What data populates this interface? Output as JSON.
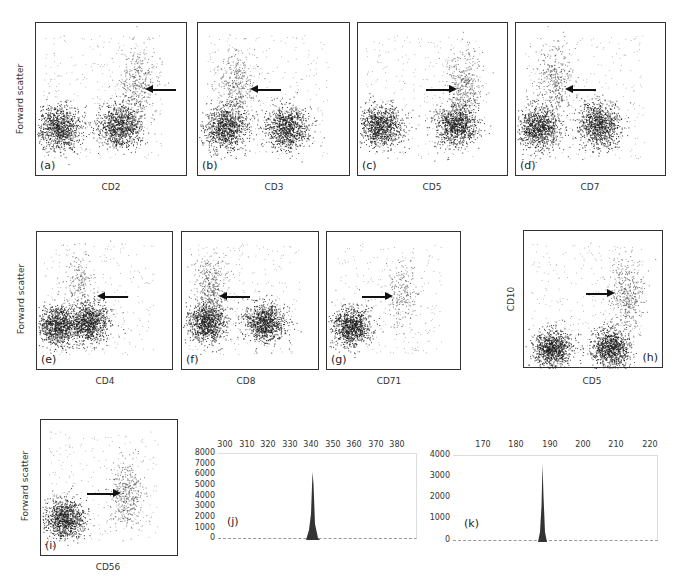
{
  "figure": {
    "scatter_panels": [
      {
        "id": "a",
        "label": "(a)",
        "xlabel": "CD2",
        "ylabel": "Forward scatter",
        "arrow": "left"
      },
      {
        "id": "b",
        "label": "(b)",
        "xlabel": "CD3",
        "ylabel": "",
        "arrow": "left"
      },
      {
        "id": "c",
        "label": "(c)",
        "xlabel": "CD5",
        "ylabel": "",
        "arrow": "right"
      },
      {
        "id": "d",
        "label": "(d)",
        "xlabel": "CD7",
        "ylabel": "",
        "arrow": "left"
      },
      {
        "id": "e",
        "label": "(e)",
        "xlabel": "CD4",
        "ylabel": "Forward scatter",
        "arrow": "left"
      },
      {
        "id": "f",
        "label": "(f)",
        "xlabel": "CD8",
        "ylabel": "",
        "arrow": "left"
      },
      {
        "id": "g",
        "label": "(g)",
        "xlabel": "CD71",
        "ylabel": "",
        "arrow": "right"
      },
      {
        "id": "h",
        "label": "(h)",
        "xlabel": "CD5",
        "ylabel": "CD10",
        "arrow": "right"
      },
      {
        "id": "i",
        "label": "(i)",
        "xlabel": "CD56",
        "ylabel": "Forward scatter",
        "arrow": "right"
      }
    ]
  },
  "chart_data": [
    {
      "type": "scatter",
      "panel": "(a)",
      "title": "",
      "xlabel": "CD2",
      "ylabel": "Forward scatter",
      "annotation": "arrow pointing left at CD2-bright high-FSC population",
      "clusters": [
        {
          "x": 0.15,
          "y": 0.32,
          "density": "high"
        },
        {
          "x": 0.55,
          "y": 0.33,
          "density": "high"
        },
        {
          "x": 0.67,
          "y": 0.6,
          "density": "medium",
          "note": "arrow target"
        }
      ]
    },
    {
      "type": "scatter",
      "panel": "(b)",
      "title": "",
      "xlabel": "CD3",
      "ylabel": "",
      "annotation": "arrow pointing left at CD3-negative high-FSC population",
      "clusters": [
        {
          "x": 0.18,
          "y": 0.32,
          "density": "high"
        },
        {
          "x": 0.58,
          "y": 0.32,
          "density": "high"
        },
        {
          "x": 0.25,
          "y": 0.58,
          "density": "medium",
          "note": "arrow target"
        }
      ]
    },
    {
      "type": "scatter",
      "panel": "(c)",
      "title": "",
      "xlabel": "CD5",
      "ylabel": "",
      "annotation": "arrow pointing right at CD5-bright high-FSC population",
      "clusters": [
        {
          "x": 0.15,
          "y": 0.33,
          "density": "high"
        },
        {
          "x": 0.65,
          "y": 0.34,
          "density": "high"
        },
        {
          "x": 0.7,
          "y": 0.6,
          "density": "medium",
          "note": "arrow target"
        }
      ]
    },
    {
      "type": "scatter",
      "panel": "(d)",
      "title": "",
      "xlabel": "CD7",
      "ylabel": "",
      "annotation": "arrow pointing left at CD7-dim high-FSC population",
      "clusters": [
        {
          "x": 0.15,
          "y": 0.32,
          "density": "high"
        },
        {
          "x": 0.55,
          "y": 0.34,
          "density": "high"
        },
        {
          "x": 0.25,
          "y": 0.62,
          "density": "medium",
          "note": "arrow target"
        }
      ]
    },
    {
      "type": "scatter",
      "panel": "(e)",
      "title": "",
      "xlabel": "CD4",
      "ylabel": "Forward scatter",
      "annotation": "arrow pointing left at high-FSC population",
      "clusters": [
        {
          "x": 0.15,
          "y": 0.33,
          "density": "high"
        },
        {
          "x": 0.38,
          "y": 0.35,
          "density": "high"
        },
        {
          "x": 0.3,
          "y": 0.6,
          "density": "low",
          "note": "arrow target"
        }
      ]
    },
    {
      "type": "scatter",
      "panel": "(f)",
      "title": "",
      "xlabel": "CD8",
      "ylabel": "",
      "annotation": "arrow pointing left at CD8-negative high-FSC population",
      "clusters": [
        {
          "x": 0.18,
          "y": 0.35,
          "density": "high"
        },
        {
          "x": 0.6,
          "y": 0.35,
          "density": "high"
        },
        {
          "x": 0.2,
          "y": 0.6,
          "density": "medium",
          "note": "arrow target"
        }
      ]
    },
    {
      "type": "scatter",
      "panel": "(g)",
      "title": "",
      "xlabel": "CD71",
      "ylabel": "",
      "annotation": "arrow pointing right at CD71-positive high-FSC population",
      "clusters": [
        {
          "x": 0.18,
          "y": 0.32,
          "density": "high"
        },
        {
          "x": 0.55,
          "y": 0.55,
          "density": "low",
          "note": "arrow target"
        }
      ]
    },
    {
      "type": "scatter",
      "panel": "(h)",
      "title": "",
      "xlabel": "CD5",
      "ylabel": "CD10",
      "annotation": "arrow pointing right at CD5+CD10+ population",
      "clusters": [
        {
          "x": 0.2,
          "y": 0.15,
          "density": "high"
        },
        {
          "x": 0.62,
          "y": 0.15,
          "density": "high"
        },
        {
          "x": 0.73,
          "y": 0.55,
          "density": "medium",
          "note": "arrow target"
        }
      ]
    },
    {
      "type": "scatter",
      "panel": "(i)",
      "title": "",
      "xlabel": "CD56",
      "ylabel": "Forward scatter",
      "annotation": "arrow pointing right at CD56-positive population",
      "clusters": [
        {
          "x": 0.17,
          "y": 0.28,
          "density": "high"
        },
        {
          "x": 0.62,
          "y": 0.45,
          "density": "medium",
          "note": "arrow target"
        }
      ]
    },
    {
      "type": "area",
      "panel": "(j)",
      "title": "",
      "xlabel": "",
      "ylabel": "",
      "xlim": [
        297,
        388
      ],
      "ylim": [
        0,
        8000
      ],
      "xticks": [
        300,
        310,
        320,
        330,
        340,
        350,
        360,
        370,
        380
      ],
      "yticks": [
        0,
        1000,
        2000,
        3000,
        4000,
        5000,
        6000,
        7000,
        8000
      ],
      "x": [
        336,
        337,
        338,
        339,
        340,
        341,
        342,
        343
      ],
      "values": [
        0,
        200,
        900,
        2500,
        6300,
        1500,
        300,
        0
      ],
      "peak": {
        "x": 340,
        "y": 6300
      },
      "grid": false
    },
    {
      "type": "area",
      "panel": "(k)",
      "title": "",
      "xlabel": "",
      "ylabel": "",
      "xlim": [
        161,
        223
      ],
      "ylim": [
        0,
        4000
      ],
      "xticks": [
        170,
        180,
        190,
        200,
        210,
        220
      ],
      "yticks": [
        0,
        1000,
        2000,
        3000,
        4000
      ],
      "x": [
        185,
        186,
        187,
        188,
        189
      ],
      "values": [
        0,
        500,
        3600,
        400,
        0
      ],
      "peak": {
        "x": 187,
        "y": 3600
      },
      "grid": false
    }
  ],
  "hist_j": {
    "label": "(j)",
    "yticks": [
      "8000",
      "7000",
      "6000",
      "5000",
      "4000",
      "3000",
      "2000",
      "1000",
      "0"
    ],
    "xticks": [
      "300",
      "310",
      "320",
      "330",
      "340",
      "350",
      "360",
      "370",
      "380"
    ]
  },
  "hist_k": {
    "label": "(k)",
    "yticks": [
      "4000",
      "3000",
      "2000",
      "1000",
      "0"
    ],
    "xticks": [
      "170",
      "180",
      "190",
      "200",
      "210",
      "220"
    ]
  }
}
